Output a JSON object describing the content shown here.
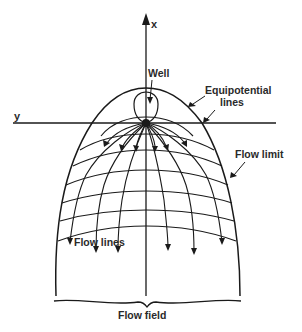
{
  "figure": {
    "type": "flow net diagram",
    "colors": {
      "line": "#1a1a1a",
      "text": "#2a2a2a",
      "background": "#ffffff"
    }
  },
  "axes": {
    "vertical_label": "x",
    "horizontal_label": "y"
  },
  "labels": {
    "well": "Well",
    "equipotential_line1": "Equipotential",
    "equipotential_line2": "lines",
    "flow_limit": "Flow limit",
    "flow_lines": "Flow lines",
    "flow_field": "Flow field"
  },
  "elements": {
    "well_point": "filled dot at axis origin",
    "flow_line_count": 13,
    "equipotential_line_count": 7
  }
}
